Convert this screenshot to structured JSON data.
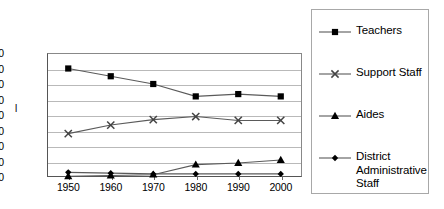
{
  "chart_data": {
    "type": "line",
    "title": "",
    "subtitle": "",
    "xlabel": "",
    "ylabel": "l",
    "categories": [
      "1950",
      "1960",
      "1970",
      "1980",
      "1990",
      "2000"
    ],
    "x": [
      1950,
      1960,
      1970,
      1980,
      1990,
      2000
    ],
    "xlim": [
      1945,
      2005
    ],
    "ylim": [
      0,
      80
    ],
    "ytick_labels": [
      "0",
      "10",
      "20",
      "30",
      "40",
      "50",
      "60",
      "70",
      "80"
    ],
    "yticks": [
      0,
      10,
      20,
      30,
      40,
      50,
      60,
      70,
      80
    ],
    "grid": "horizontal",
    "legend_position": "right",
    "series": [
      {
        "name": "Teachers",
        "marker": "square",
        "color": "#000000",
        "values": [
          70,
          65,
          60,
          52,
          53.5,
          52
        ]
      },
      {
        "name": "Support Staff",
        "marker": "x",
        "color": "#444444",
        "values": [
          28,
          33.5,
          37,
          39,
          36.5,
          36.5
        ]
      },
      {
        "name": "Aides",
        "marker": "triangle",
        "color": "#000000",
        "values": [
          0.5,
          1,
          1.5,
          8,
          9,
          11
        ]
      },
      {
        "name": "District Administrative Staff",
        "marker": "diamond",
        "color": "#000000",
        "values": [
          3,
          2.5,
          2,
          2,
          2,
          2
        ]
      }
    ]
  },
  "legend": {
    "entries": [
      {
        "label": "Teachers",
        "marker": "square-marker-icon"
      },
      {
        "label": "Support Staff",
        "marker": "x-marker-icon"
      },
      {
        "label": "Aides",
        "marker": "triangle-marker-icon"
      },
      {
        "label": "District Administrative Staff",
        "marker": "diamond-marker-icon"
      }
    ]
  },
  "colors": {
    "gridline": "#b9b9b9",
    "axis": "#555555",
    "series_line": "#5a5a5a",
    "marker": "#000000",
    "legend_border": "#a8a8a8",
    "background": "#ffffff"
  }
}
